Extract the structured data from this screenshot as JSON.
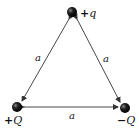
{
  "diagram": {
    "type": "equilateral-triangle-charges",
    "charges": [
      {
        "id": "top",
        "label_sign": "+",
        "label_symbol": "q",
        "position": "top"
      },
      {
        "id": "bottom-left",
        "label_sign": "+",
        "label_symbol": "Q",
        "position": "bottom-left"
      },
      {
        "id": "bottom-right",
        "label_sign": "−",
        "label_symbol": "Q",
        "position": "bottom-right"
      }
    ],
    "sides": [
      {
        "from": "top",
        "to": "bottom-left",
        "label": "a"
      },
      {
        "from": "top",
        "to": "bottom-right",
        "label": "a"
      },
      {
        "from": "bottom-left",
        "to": "bottom-right",
        "label": "a"
      }
    ],
    "colors": {
      "line": "#333333",
      "charge": "#111111",
      "background": "#ffffff"
    }
  }
}
